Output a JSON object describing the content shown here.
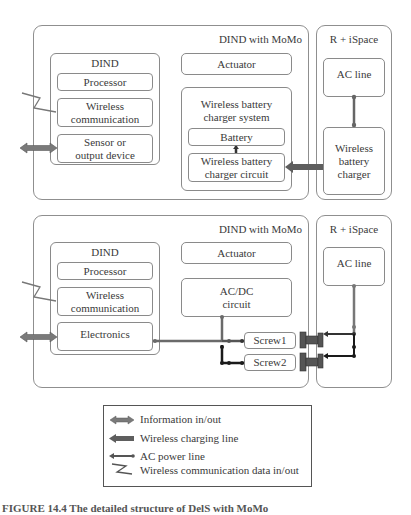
{
  "top_section": {
    "outer_title": "DIND with MoMo",
    "dind": {
      "title": "DIND",
      "processor": "Processor",
      "wireless_comm": [
        "Wireless",
        "communication"
      ],
      "sensor": [
        "Sensor or",
        "output device"
      ]
    },
    "actuator": "Actuator",
    "wbc_system": {
      "title": [
        "Wireless battery",
        "charger system"
      ],
      "battery": "Battery",
      "circuit": [
        "Wireless battery",
        "charger circuit"
      ]
    },
    "space": {
      "title": "R + iSpace",
      "ac_line": "AC line",
      "charger": [
        "Wireless",
        "battery",
        "charger"
      ]
    }
  },
  "bottom_section": {
    "outer_title": "DIND with MoMo",
    "dind": {
      "title": "DIND",
      "processor": "Processor",
      "wireless_comm": [
        "Wireless",
        "communication"
      ],
      "electronics": "Electronics"
    },
    "actuator": "Actuator",
    "acdc": [
      "AC/DC",
      "circuit"
    ],
    "screw1": "Screw1",
    "screw2": "Screw2",
    "space": {
      "title": "R + iSpace",
      "ac_line": "AC line"
    }
  },
  "legend": {
    "items": [
      {
        "icon": "double-arrow",
        "label": "Information in/out"
      },
      {
        "icon": "thick-arrow",
        "label": "Wireless charging line"
      },
      {
        "icon": "power-line",
        "label": "AC power line"
      },
      {
        "icon": "zigzag",
        "label": "Wireless communication data in/out"
      }
    ]
  },
  "caption": "FIGURE 14.4  The detailed structure of DelS with MoMo",
  "colors": {
    "border": "#8a8a8a",
    "info_arrow": "#6e6e6e",
    "charging_arrow": "#5e5e5e",
    "ac_line": "#666666",
    "dc_line": "#1a1a1a",
    "connector": "#4a4a4a"
  }
}
